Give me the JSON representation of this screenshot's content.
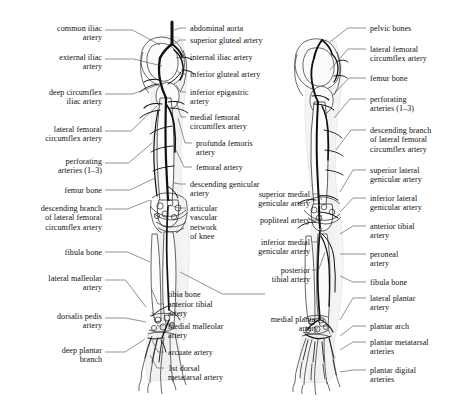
{
  "figure": {
    "background_color": "#ffffff",
    "ink_color": "#1a1a1a",
    "leader_color": "#4a4a4a",
    "views": [
      {
        "name": "anterior-view",
        "side": "left",
        "description": "anterior view of pelvis, femur, tibia, fibula and foot with arterial tree"
      },
      {
        "name": "posterior-view",
        "side": "right",
        "description": "posterior view of pelvis, femur, tibia, fibula and foot with arterial tree"
      }
    ]
  },
  "labels": {
    "column_left": [
      {
        "id": "common-iliac-artery",
        "text": "common iliac\nartery",
        "x": 6,
        "y": 24,
        "w": 96,
        "lx": 105,
        "ly": 30,
        "tx": 160,
        "ty": 45
      },
      {
        "id": "external-iliac-artery",
        "text": "external iliac\nartery",
        "x": 6,
        "y": 53,
        "w": 96,
        "lx": 105,
        "ly": 59,
        "tx": 162,
        "ty": 66
      },
      {
        "id": "deep-circumflex-iliac-artery",
        "text": "deep circumflex\niliac artery",
        "x": 2,
        "y": 88,
        "w": 100,
        "lx": 105,
        "ly": 94,
        "tx": 160,
        "ty": 84
      },
      {
        "id": "lateral-femoral-circumflex-artery-left",
        "text": "lateral femoral\ncircumflex artery",
        "x": 0,
        "y": 125,
        "w": 102,
        "lx": 105,
        "ly": 131,
        "tx": 157,
        "ty": 106
      },
      {
        "id": "perforating-arteries-left",
        "text": "perforating\narteries (1–3)",
        "x": 6,
        "y": 157,
        "w": 96,
        "lx": 105,
        "ly": 163,
        "tx": 152,
        "ty": 143
      },
      {
        "id": "femur-bone-left",
        "text": "femur bone",
        "x": 6,
        "y": 186,
        "w": 96,
        "lx": 105,
        "ly": 190,
        "tx": 155,
        "ty": 178
      },
      {
        "id": "descending-branch-lateral-femoral-circumflex-left",
        "text": "descending branch\nof lateral femoral\ncircumflex artery",
        "x": 0,
        "y": 204,
        "w": 102,
        "lx": 105,
        "ly": 209,
        "tx": 150,
        "ty": 200
      },
      {
        "id": "fibula-bone-left",
        "text": "fibula bone",
        "x": 6,
        "y": 248,
        "w": 96,
        "lx": 105,
        "ly": 252,
        "tx": 150,
        "ty": 262
      },
      {
        "id": "lateral-malleolar-artery",
        "text": "lateral malleolar\nartery",
        "x": 2,
        "y": 274,
        "w": 100,
        "lx": 105,
        "ly": 280,
        "tx": 146,
        "ty": 307
      },
      {
        "id": "dorsalis-pedis-artery",
        "text": "dorsalis pedis\nartery",
        "x": 6,
        "y": 312,
        "w": 96,
        "lx": 105,
        "ly": 318,
        "tx": 146,
        "ty": 322
      },
      {
        "id": "deep-plantar-branch",
        "text": "deep plantar\nbranch",
        "x": 6,
        "y": 346,
        "w": 96,
        "lx": 105,
        "ly": 352,
        "tx": 145,
        "ty": 339
      }
    ],
    "column_center_left": [
      {
        "id": "abdominal-aorta",
        "text": "abdominal aorta",
        "x": 190,
        "y": 24,
        "w": 110,
        "lx": 186,
        "ly": 28,
        "tx": 174,
        "ty": 30
      },
      {
        "id": "superior-gluteal-artery",
        "text": "superior gluteal artery",
        "x": 190,
        "y": 36,
        "w": 110,
        "lx": 186,
        "ly": 40,
        "tx": 174,
        "ty": 44
      },
      {
        "id": "internal-iliac-artery",
        "text": "internal iliac artery",
        "x": 190,
        "y": 53,
        "w": 110,
        "lx": 186,
        "ly": 57,
        "tx": 176,
        "ty": 58
      },
      {
        "id": "inferior-gluteal-artery",
        "text": "inferior gluteal artery",
        "x": 190,
        "y": 70,
        "w": 110,
        "lx": 186,
        "ly": 74,
        "tx": 176,
        "ty": 70
      },
      {
        "id": "inferior-epigastric-artery",
        "text": "inferior epigastric\nartery",
        "x": 190,
        "y": 88,
        "w": 110,
        "lx": 186,
        "ly": 92,
        "tx": 176,
        "ty": 85
      },
      {
        "id": "medial-femoral-circumflex-artery",
        "text": "medial femoral\ncircumflex artery",
        "x": 190,
        "y": 113,
        "w": 110,
        "lx": 186,
        "ly": 117,
        "tx": 176,
        "ty": 101
      },
      {
        "id": "profunda-femoris-artery",
        "text": "profunda femoris\nartery",
        "x": 196,
        "y": 139,
        "w": 104,
        "lx": 192,
        "ly": 143,
        "tx": 178,
        "ty": 118
      },
      {
        "id": "femoral-artery",
        "text": "femoral artery",
        "x": 196,
        "y": 163,
        "w": 104,
        "lx": 192,
        "ly": 167,
        "tx": 176,
        "ty": 150
      },
      {
        "id": "descending-genicular-artery",
        "text": "descending genicular\nartery",
        "x": 190,
        "y": 180,
        "w": 110,
        "lx": 186,
        "ly": 184,
        "tx": 174,
        "ty": 183
      },
      {
        "id": "articular-vascular-network-of-knee",
        "text": "articular\nvascular\nnetwork\nof knee",
        "x": 190,
        "y": 204,
        "w": 110,
        "lx": 186,
        "ly": 208,
        "tx": 170,
        "ty": 205
      },
      {
        "id": "tibia-bone",
        "text": "tibia bone",
        "x": 168,
        "y": 290,
        "w": 96,
        "lx": 265,
        "ly": 294,
        "tx": 180,
        "ty": 272
      },
      {
        "id": "anterior-tibial-artery-left",
        "text": "anterior tibial\nartery",
        "x": 168,
        "y": 300,
        "w": 96,
        "lx": 164,
        "ly": 304,
        "tx": 152,
        "ty": 290
      },
      {
        "id": "medial-malleolar-artery",
        "text": "medial malleolar\nartery",
        "x": 168,
        "y": 322,
        "w": 96,
        "lx": 164,
        "ly": 326,
        "tx": 152,
        "ty": 312
      },
      {
        "id": "arcuate-artery",
        "text": "arcuate artery",
        "x": 168,
        "y": 348,
        "w": 96,
        "lx": 164,
        "ly": 352,
        "tx": 152,
        "ty": 340
      },
      {
        "id": "1st-dorsal-metatarsal-artery",
        "text": "1st dorsal\nmetatarsal artery",
        "x": 168,
        "y": 364,
        "w": 96,
        "lx": 164,
        "ly": 368,
        "tx": 150,
        "ty": 355
      }
    ],
    "column_center_right": [
      {
        "id": "superior-medial-genicular-artery",
        "text": "superior medial\ngenicular artery",
        "x": 212,
        "y": 190,
        "w": 98,
        "lx": 312,
        "ly": 194,
        "tx": 322,
        "ty": 200
      },
      {
        "id": "popliteal-artery",
        "text": "popliteal artery",
        "x": 212,
        "y": 216,
        "w": 98,
        "lx": 312,
        "ly": 220,
        "tx": 322,
        "ty": 215
      },
      {
        "id": "inferior-medial-genicular-artery",
        "text": "inferior medial\ngenicular artery",
        "x": 212,
        "y": 238,
        "w": 98,
        "lx": 312,
        "ly": 242,
        "tx": 322,
        "ty": 228
      },
      {
        "id": "posterior-tibial-artery",
        "text": "posterior\ntibial artery",
        "x": 212,
        "y": 266,
        "w": 98,
        "lx": 312,
        "ly": 270,
        "tx": 325,
        "ty": 252
      },
      {
        "id": "medial-plantar-artery",
        "text": "medial plantar\nartery",
        "x": 232,
        "y": 315,
        "w": 86,
        "lx": 320,
        "ly": 319,
        "tx": 330,
        "ty": 334
      }
    ],
    "column_right": [
      {
        "id": "pelvic-bones",
        "text": "pelvic bones",
        "x": 370,
        "y": 24,
        "w": 96,
        "lx": 366,
        "ly": 28,
        "tx": 330,
        "ty": 42
      },
      {
        "id": "lateral-femoral-circumflex-artery-right",
        "text": "lateral femoral\ncircumflex artery",
        "x": 370,
        "y": 45,
        "w": 96,
        "lx": 366,
        "ly": 49,
        "tx": 330,
        "ty": 70
      },
      {
        "id": "femur-bone-right",
        "text": "femur bone",
        "x": 370,
        "y": 74,
        "w": 96,
        "lx": 366,
        "ly": 78,
        "tx": 332,
        "ty": 96
      },
      {
        "id": "perforating-arteries-right",
        "text": "perforating\narteries (1–3)",
        "x": 370,
        "y": 95,
        "w": 96,
        "lx": 366,
        "ly": 99,
        "tx": 334,
        "ty": 118
      },
      {
        "id": "descending-branch-lateral-femoral-circumflex-right",
        "text": "descending branch\nof lateral femoral\ncircumflex artery",
        "x": 370,
        "y": 126,
        "w": 96,
        "lx": 366,
        "ly": 130,
        "tx": 336,
        "ty": 150
      },
      {
        "id": "superior-lateral-genicular-artery",
        "text": "superior lateral\ngenicular artery",
        "x": 370,
        "y": 166,
        "w": 96,
        "lx": 366,
        "ly": 170,
        "tx": 340,
        "ty": 192
      },
      {
        "id": "inferior-lateral-genicular-artery",
        "text": "inferior lateral\ngenicular artery",
        "x": 370,
        "y": 194,
        "w": 96,
        "lx": 366,
        "ly": 198,
        "tx": 340,
        "ty": 212
      },
      {
        "id": "anterior-tibial-artery-right",
        "text": "anterior tibial\nartery",
        "x": 370,
        "y": 222,
        "w": 96,
        "lx": 366,
        "ly": 226,
        "tx": 340,
        "ty": 234
      },
      {
        "id": "peroneal-artery",
        "text": "peroneal\nartery",
        "x": 370,
        "y": 250,
        "w": 96,
        "lx": 366,
        "ly": 254,
        "tx": 340,
        "ty": 254
      },
      {
        "id": "fibula-bone-right",
        "text": "fibula bone",
        "x": 370,
        "y": 278,
        "w": 96,
        "lx": 366,
        "ly": 282,
        "tx": 340,
        "ty": 276
      },
      {
        "id": "lateral-plantar-artery",
        "text": "lateral plantar\nartery",
        "x": 370,
        "y": 294,
        "w": 96,
        "lx": 366,
        "ly": 298,
        "tx": 340,
        "ty": 320
      },
      {
        "id": "plantar-arch",
        "text": "plantar arch",
        "x": 370,
        "y": 322,
        "w": 96,
        "lx": 366,
        "ly": 326,
        "tx": 340,
        "ty": 336
      },
      {
        "id": "plantar-metatarsal-arteries",
        "text": "plantar metatarsal\narteries",
        "x": 370,
        "y": 338,
        "w": 96,
        "lx": 366,
        "ly": 342,
        "tx": 340,
        "ty": 350
      },
      {
        "id": "plantar-digital-arteries",
        "text": "plantar digital\narteries",
        "x": 370,
        "y": 366,
        "w": 96,
        "lx": 366,
        "ly": 370,
        "tx": 340,
        "ty": 372
      }
    ]
  }
}
